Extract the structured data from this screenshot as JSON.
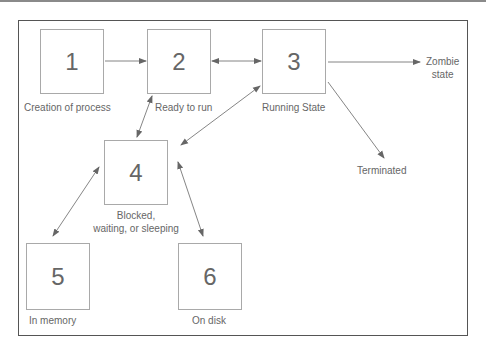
{
  "diagram": {
    "title": "",
    "nodes": [
      {
        "id": "1",
        "number": "1",
        "label": "Creation of process"
      },
      {
        "id": "2",
        "number": "2",
        "label": "Ready to run"
      },
      {
        "id": "3",
        "number": "3",
        "label": "Running State"
      },
      {
        "id": "4",
        "number": "4",
        "label_line1": "Blocked,",
        "label_line2": "waiting, or sleeping"
      },
      {
        "id": "5",
        "number": "5",
        "label": "In memory"
      },
      {
        "id": "6",
        "number": "6",
        "label": "On disk"
      }
    ],
    "terminals": {
      "zombie_line1": "Zombie",
      "zombie_line2": "state",
      "terminated": "Terminated"
    },
    "edges": [
      {
        "from": "1",
        "to": "2",
        "direction": "forward"
      },
      {
        "from": "2",
        "to": "3",
        "direction": "bidirectional"
      },
      {
        "from": "3",
        "to": "zombie",
        "direction": "forward"
      },
      {
        "from": "3",
        "to": "terminated",
        "direction": "forward"
      },
      {
        "from": "2",
        "to": "4",
        "direction": "bidirectional"
      },
      {
        "from": "3",
        "to": "4",
        "direction": "bidirectional"
      },
      {
        "from": "4",
        "to": "5",
        "direction": "bidirectional"
      },
      {
        "from": "4",
        "to": "6",
        "direction": "bidirectional"
      }
    ],
    "colors": {
      "frame": "#555555",
      "box_border": "#a9a9a9",
      "arrow": "#666666",
      "text": "#666666"
    }
  }
}
